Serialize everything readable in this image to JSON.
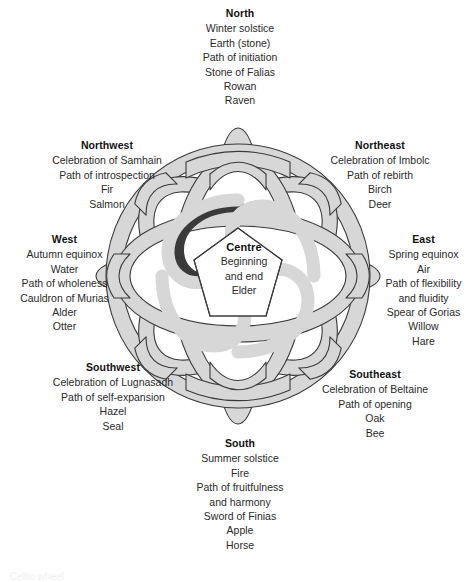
{
  "figure": {
    "centre": {
      "heading": "Centre",
      "lines": [
        "Beginning",
        "and end",
        "Elder"
      ]
    },
    "bottom_caption": "Celtic wheel"
  },
  "colors": {
    "band_fill": "#d7d7d7",
    "band_stroke": "#3a3a3a",
    "background": "#ffffff",
    "text": "#1a1a1a"
  },
  "directions": [
    {
      "key": "north",
      "heading": "North",
      "align": "center",
      "lines": [
        "Winter solstice",
        "Earth (stone)",
        "Path of initiation",
        "Stone of Falias",
        "Rowan",
        "Raven"
      ]
    },
    {
      "key": "northeast",
      "heading": "Northeast",
      "align": "center",
      "lines": [
        "Celebration of Imbolc",
        "Path of rebirth",
        "Birch",
        "Deer"
      ]
    },
    {
      "key": "east",
      "heading": "East",
      "align": "center",
      "lines": [
        "Spring equinox",
        "Air",
        "Path of flexibility",
        "and fluidity",
        "Spear of Gorias",
        "Willow",
        "Hare"
      ]
    },
    {
      "key": "southeast",
      "heading": "Southeast",
      "align": "center",
      "lines": [
        "Celebration of Beltaine",
        "Path of opening",
        "Oak",
        "Bee"
      ]
    },
    {
      "key": "south",
      "heading": "South",
      "align": "center",
      "lines": [
        "Summer solstice",
        "Fire",
        "Path of fruitfulness",
        "and harmony",
        "Sword of Finias",
        "Apple",
        "Horse"
      ]
    },
    {
      "key": "southwest",
      "heading": "Southwest",
      "align": "center",
      "lines": [
        "Celebration of Lugnasadh",
        "Path of self-expansion",
        "Hazel",
        "Seal"
      ]
    },
    {
      "key": "west",
      "heading": "West",
      "align": "center",
      "lines": [
        "Autumn equinox",
        "Water",
        "Path of wholeness",
        "Cauldron of Murias",
        "Alder",
        "Otter"
      ]
    },
    {
      "key": "northwest",
      "heading": "Northwest",
      "align": "center",
      "lines": [
        "Celebration of Samhain",
        "Path of introspection",
        "Fir",
        "Salmon"
      ]
    }
  ]
}
